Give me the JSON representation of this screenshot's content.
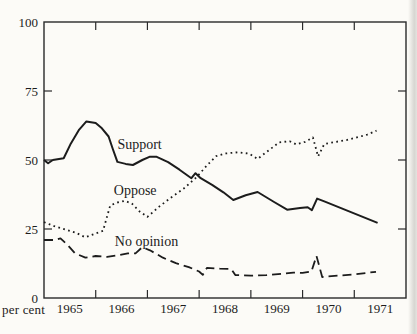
{
  "chart_data": {
    "type": "line",
    "title": "",
    "xlabel": "",
    "ylabel": "per cent",
    "line_color": "#1c1c1c",
    "frame_color": "#2a2a2a",
    "background_color": "#fcfbf7",
    "y_axis": {
      "min": 0,
      "max": 100,
      "labels": [
        0,
        25,
        50,
        75,
        100
      ],
      "inner_tick_values": [
        25,
        50,
        75
      ]
    },
    "x_axis": {
      "start_year": 1965,
      "end_year": 1972,
      "boundary_tick_years": [
        1966,
        1967,
        1968,
        1969,
        1970,
        1971
      ],
      "year_labels": [
        "1965",
        "1966",
        "1967",
        "1968",
        "1969",
        "1970",
        "1971"
      ]
    },
    "series": [
      {
        "name": "Support",
        "style": "solid",
        "label": "Support",
        "label_anchor": {
          "year": 1966.42,
          "value": 54.0
        },
        "points": [
          [
            1965.0,
            50
          ],
          [
            1965.08,
            48.8
          ],
          [
            1965.17,
            50
          ],
          [
            1965.38,
            50.6
          ],
          [
            1965.52,
            56
          ],
          [
            1965.68,
            61
          ],
          [
            1965.82,
            64
          ],
          [
            1966.0,
            63.4
          ],
          [
            1966.12,
            61.5
          ],
          [
            1966.25,
            58.5
          ],
          [
            1966.33,
            54
          ],
          [
            1966.42,
            49.3
          ],
          [
            1966.58,
            48.6
          ],
          [
            1966.72,
            48.2
          ],
          [
            1966.9,
            50
          ],
          [
            1967.05,
            51.2
          ],
          [
            1967.17,
            51.2
          ],
          [
            1967.4,
            49.2
          ],
          [
            1967.62,
            46.5
          ],
          [
            1967.85,
            43.4
          ],
          [
            1967.93,
            45.2
          ],
          [
            1968.03,
            43.4
          ],
          [
            1968.25,
            41
          ],
          [
            1968.47,
            38.3
          ],
          [
            1968.66,
            35.5
          ],
          [
            1968.9,
            37.2
          ],
          [
            1969.13,
            38.4
          ],
          [
            1969.45,
            34.8
          ],
          [
            1969.7,
            32
          ],
          [
            1969.95,
            32.6
          ],
          [
            1970.1,
            32.9
          ],
          [
            1970.18,
            31.8
          ],
          [
            1970.28,
            36
          ],
          [
            1970.42,
            35
          ],
          [
            1971.45,
            27.2
          ]
        ]
      },
      {
        "name": "Oppose",
        "style": "dotted",
        "label": "Oppose",
        "label_anchor": {
          "year": 1966.35,
          "value": 37.2
        },
        "points": [
          [
            1965.0,
            27.5
          ],
          [
            1965.2,
            26
          ],
          [
            1965.42,
            24.8
          ],
          [
            1965.62,
            23.6
          ],
          [
            1965.8,
            22
          ],
          [
            1966.0,
            23.4
          ],
          [
            1966.14,
            24.3
          ],
          [
            1966.28,
            33.5
          ],
          [
            1966.42,
            34.6
          ],
          [
            1966.56,
            35.2
          ],
          [
            1966.7,
            34.2
          ],
          [
            1966.85,
            31.3
          ],
          [
            1967.0,
            29.4
          ],
          [
            1967.22,
            33
          ],
          [
            1967.45,
            36.3
          ],
          [
            1967.7,
            39.6
          ],
          [
            1967.95,
            43.8
          ],
          [
            1968.15,
            48
          ],
          [
            1968.33,
            51.4
          ],
          [
            1968.52,
            52.4
          ],
          [
            1968.75,
            52.8
          ],
          [
            1968.97,
            52.3
          ],
          [
            1969.13,
            50.4
          ],
          [
            1969.35,
            53.6
          ],
          [
            1969.55,
            56.4
          ],
          [
            1969.75,
            56.8
          ],
          [
            1969.88,
            55.6
          ],
          [
            1970.05,
            56.6
          ],
          [
            1970.2,
            58.2
          ],
          [
            1970.3,
            51.3
          ],
          [
            1970.42,
            55.8
          ],
          [
            1970.65,
            56.6
          ],
          [
            1970.85,
            57.2
          ],
          [
            1971.05,
            58.2
          ],
          [
            1971.25,
            59.2
          ],
          [
            1971.43,
            60.6
          ]
        ]
      },
      {
        "name": "No opinion",
        "style": "dashed",
        "label": "No opinion",
        "label_anchor": {
          "year": 1966.37,
          "value": 18.8
        },
        "points": [
          [
            1965.0,
            21
          ],
          [
            1965.22,
            21
          ],
          [
            1965.32,
            21.6
          ],
          [
            1965.45,
            19.3
          ],
          [
            1965.6,
            16.2
          ],
          [
            1965.8,
            14.6
          ],
          [
            1966.0,
            15.2
          ],
          [
            1966.22,
            14.9
          ],
          [
            1966.45,
            15.5
          ],
          [
            1966.62,
            16.2
          ],
          [
            1966.77,
            16.2
          ],
          [
            1966.9,
            18.4
          ],
          [
            1967.05,
            17.3
          ],
          [
            1967.3,
            14.6
          ],
          [
            1967.55,
            12.6
          ],
          [
            1967.8,
            11.2
          ],
          [
            1968.0,
            9.6
          ],
          [
            1968.07,
            8.4
          ],
          [
            1968.15,
            10.9
          ],
          [
            1968.4,
            10.6
          ],
          [
            1968.62,
            10.5
          ],
          [
            1968.7,
            8.3
          ],
          [
            1969.0,
            8.1
          ],
          [
            1969.3,
            8.3
          ],
          [
            1969.6,
            8.8
          ],
          [
            1969.82,
            9.2
          ],
          [
            1970.0,
            9.1
          ],
          [
            1970.17,
            9.6
          ],
          [
            1970.27,
            15.2
          ],
          [
            1970.38,
            7.6
          ],
          [
            1970.7,
            8.1
          ],
          [
            1971.0,
            8.6
          ],
          [
            1971.42,
            9.5
          ]
        ]
      }
    ]
  }
}
